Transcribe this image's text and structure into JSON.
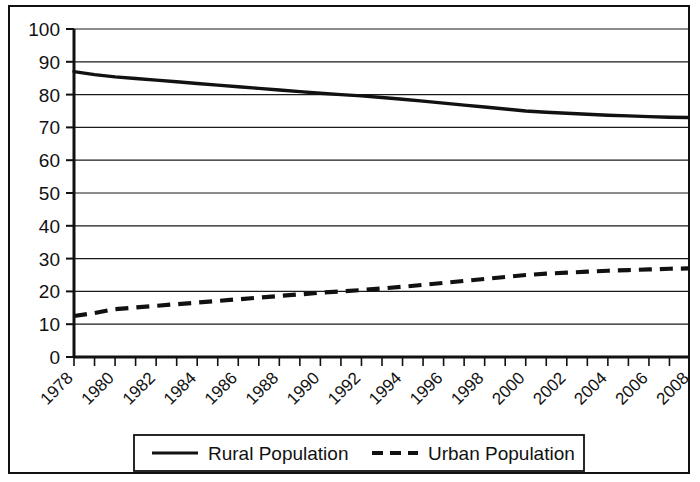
{
  "chart_data": {
    "type": "line",
    "title": "",
    "xlabel": "",
    "ylabel": "",
    "xlim": [
      1978,
      2008
    ],
    "ylim": [
      0,
      100
    ],
    "grid": true,
    "legend_position": "bottom",
    "x": [
      1978,
      1979,
      1980,
      1981,
      1982,
      1983,
      1984,
      1985,
      1986,
      1987,
      1988,
      1989,
      1990,
      1991,
      1992,
      1993,
      1994,
      1995,
      1996,
      1997,
      1998,
      1999,
      2000,
      2001,
      2002,
      2003,
      2004,
      2005,
      2006,
      2007,
      2008
    ],
    "x_tick_labels": [
      "1978",
      "1980",
      "1982",
      "1984",
      "1986",
      "1988",
      "1990",
      "1992",
      "1994",
      "1996",
      "1998",
      "2000",
      "2002",
      "2004",
      "2006",
      "2008"
    ],
    "y_tick_labels": [
      "100",
      "90",
      "80",
      "70",
      "60",
      "50",
      "40",
      "30",
      "20",
      "10",
      "0"
    ],
    "y_ticks": [
      0,
      10,
      20,
      30,
      40,
      50,
      60,
      70,
      80,
      90,
      100
    ],
    "series": [
      {
        "name": "Rural Population",
        "style": "solid",
        "color": "#111111",
        "values": [
          87.0,
          86.1,
          85.4,
          84.9,
          84.4,
          83.9,
          83.4,
          82.9,
          82.4,
          81.9,
          81.4,
          80.9,
          80.4,
          80.0,
          79.6,
          79.1,
          78.6,
          78.0,
          77.4,
          76.8,
          76.2,
          75.6,
          75.0,
          74.6,
          74.3,
          74.0,
          73.7,
          73.5,
          73.3,
          73.1,
          73.0
        ]
      },
      {
        "name": "Urban Population",
        "style": "dashed",
        "color": "#111111",
        "values": [
          12.5,
          13.4,
          14.6,
          15.1,
          15.6,
          16.1,
          16.6,
          17.1,
          17.6,
          18.1,
          18.6,
          19.1,
          19.6,
          20.0,
          20.4,
          20.9,
          21.4,
          22.0,
          22.6,
          23.2,
          23.8,
          24.4,
          25.0,
          25.4,
          25.7,
          26.0,
          26.3,
          26.5,
          26.7,
          26.9,
          27.0
        ]
      }
    ]
  },
  "legend": {
    "entries": [
      {
        "label": "Rural Population",
        "style": "solid"
      },
      {
        "label": "Urban Population",
        "style": "dashed"
      }
    ]
  }
}
